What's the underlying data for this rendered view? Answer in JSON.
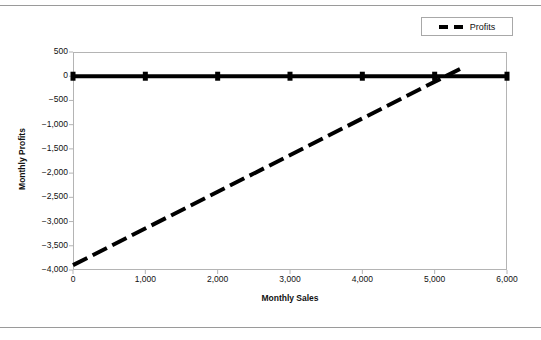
{
  "figure": {
    "background": "#ffffff",
    "frame_color": "#b4b4b4",
    "series_color": "#000000",
    "rules": {
      "top": "page-rule-top",
      "bottom": "page-rule-bottom"
    }
  },
  "legend": {
    "position": "top-right",
    "entries": [
      {
        "label": "Profits",
        "style": "dashed",
        "color": "#000000"
      }
    ]
  },
  "chart_data": {
    "type": "line",
    "title": "",
    "xlabel": "Monthly Sales",
    "ylabel": "Monthly Profits",
    "xlim": [
      0,
      6000
    ],
    "ylim": [
      -4000,
      500
    ],
    "grid": false,
    "legend_position": "top-right",
    "xticks": [
      0,
      1000,
      2000,
      3000,
      4000,
      5000,
      6000
    ],
    "xtick_labels": [
      "0",
      "1,000",
      "2,000",
      "3,000",
      "4,000",
      "5,000",
      "6,000"
    ],
    "yticks": [
      500,
      0,
      -500,
      -1000,
      -1500,
      -2000,
      -2500,
      -3000,
      -3500,
      -4000
    ],
    "ytick_labels": [
      "500",
      "0",
      "−500",
      "−1,000",
      "−1,500",
      "−2,000",
      "−2,500",
      "−3,000",
      "−3,500",
      "−4,000"
    ],
    "series": [
      {
        "name": "Break-even",
        "style": "solid",
        "color": "#000000",
        "width": 4,
        "marker": "square",
        "in_legend": false,
        "x": [
          0,
          1000,
          2000,
          3000,
          4000,
          5000,
          6000
        ],
        "values": [
          0,
          0,
          0,
          0,
          0,
          0,
          0
        ]
      },
      {
        "name": "Profits",
        "style": "dashed",
        "color": "#000000",
        "width": 4,
        "marker": "none",
        "in_legend": true,
        "x": [
          0,
          5350
        ],
        "values": [
          -3900,
          150
        ]
      }
    ],
    "annotations": [
      {
        "text": "break-even crossing",
        "x": 5200,
        "y": 0
      }
    ]
  }
}
